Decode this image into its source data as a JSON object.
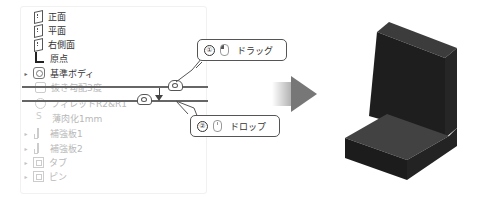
{
  "feature_tree": {
    "items": [
      {
        "label": "正面",
        "icon": "plane-icon",
        "state": "normal",
        "expandable": false
      },
      {
        "label": "平面",
        "icon": "plane-icon",
        "state": "normal",
        "expandable": false
      },
      {
        "label": "右側面",
        "icon": "plane-icon",
        "state": "normal",
        "expandable": false
      },
      {
        "label": "原点",
        "icon": "origin-icon",
        "state": "normal",
        "expandable": false
      },
      {
        "label": "基準ボディ",
        "icon": "body-icon",
        "state": "normal",
        "expandable": true
      },
      {
        "label": "抜き勾配3度",
        "icon": "draft-icon",
        "state": "suppressed",
        "expandable": false
      },
      {
        "label": "フィレットR2&R1",
        "icon": "fillet-icon",
        "state": "suppressed",
        "expandable": false
      },
      {
        "label": "薄肉化1mm",
        "icon": "shell-icon",
        "state": "suppressed",
        "expandable": false
      },
      {
        "label": "補強板1",
        "icon": "rib-icon",
        "state": "suppressed",
        "expandable": true
      },
      {
        "label": "補強板2",
        "icon": "rib-icon",
        "state": "suppressed",
        "expandable": true
      },
      {
        "label": "タブ",
        "icon": "tab-icon",
        "state": "suppressed",
        "expandable": true
      },
      {
        "label": "ピン",
        "icon": "pin-icon",
        "state": "suppressed",
        "expandable": true
      }
    ]
  },
  "callouts": {
    "drag": {
      "number": "①",
      "label": "ドラッグ",
      "icon": "mouse-left-press-icon"
    },
    "drop": {
      "number": "②",
      "label": "ドロップ",
      "icon": "mouse-release-icon"
    }
  },
  "transition_arrow": {
    "icon": "right-arrow-icon"
  },
  "model_preview": {
    "description": "L-shaped bracket 3D model",
    "color": "#2a2a2a"
  }
}
